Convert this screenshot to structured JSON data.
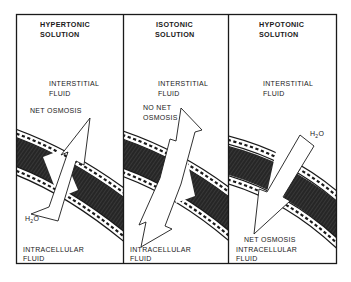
{
  "figure": {
    "type": "osmosis-diagram",
    "colors": {
      "frame": "#1a1a1a",
      "membrane_core": "#2b2b2b",
      "membrane_surface": "#ffffff",
      "background": "#ffffff"
    }
  },
  "panels": [
    {
      "title_line1": "HYPERTONIC",
      "title_line2": "SOLUTION",
      "outside_line1": "INTERSTITIAL",
      "outside_line2": "FLUID",
      "movement_line1": "NET OSMOSIS",
      "movement_line2": "",
      "water_label": "H",
      "water_sub": "2",
      "water_suffix": "O",
      "inside_line1": "INTRACELLULAR",
      "inside_line2": "FLUID",
      "arrow_direction": "out"
    },
    {
      "title_line1": "ISOTONIC",
      "title_line2": "SOLUTION",
      "outside_line1": "INTERSTITIAL",
      "outside_line2": "FLUID",
      "movement_line1": "NO NET",
      "movement_line2": "OSMOSIS",
      "inside_line1": "INTRACELLULAR",
      "inside_line2": "FLUID",
      "arrow_direction": "both"
    },
    {
      "title_line1": "HYPOTONIC",
      "title_line2": "SOLUTION",
      "outside_line1": "INTERSTITIAL",
      "outside_line2": "FLUID",
      "water_label": "H",
      "water_sub": "2",
      "water_suffix": "O",
      "movement_line1": "NET OSMOSIS",
      "inside_line1": "INTRACELLULAR",
      "inside_line2": "FLUID",
      "arrow_direction": "in"
    }
  ]
}
